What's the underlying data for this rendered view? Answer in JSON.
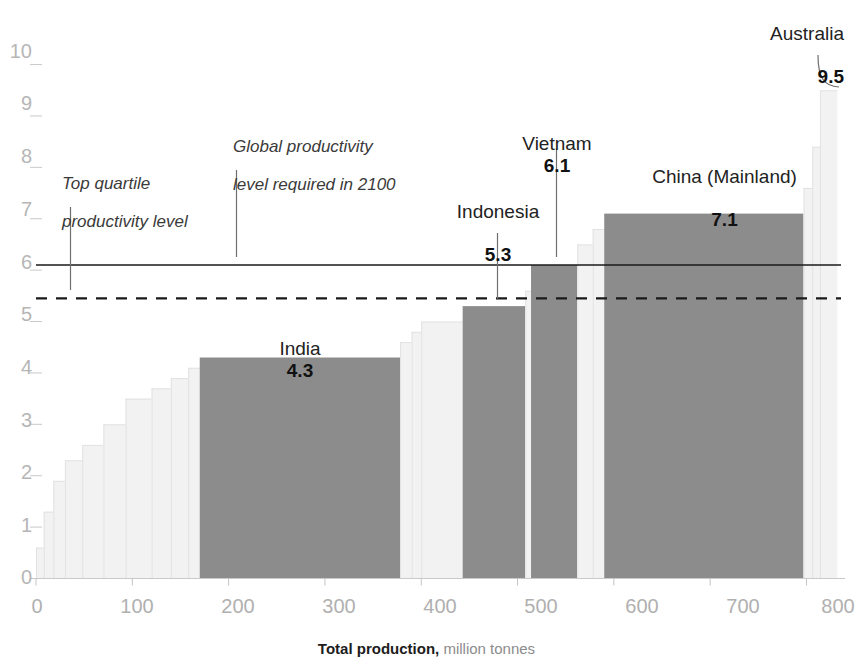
{
  "chart_data": {
    "type": "bar",
    "title": "",
    "subtitle": "",
    "xlabel_bold": "Total production,",
    "xlabel_rest": " million tonnes",
    "ylabel": "",
    "xlim": [
      0,
      840
    ],
    "ylim": [
      0,
      10.4
    ],
    "xticks": [
      0,
      100,
      200,
      300,
      400,
      500,
      600,
      700,
      800
    ],
    "xtick_labels": [
      "0",
      "100",
      "200",
      "300",
      "400",
      "500",
      "600",
      "700",
      "800"
    ],
    "yticks": [
      0,
      1,
      2,
      3,
      4,
      5,
      6,
      7,
      8,
      9,
      10
    ],
    "ytick_labels": [
      "0",
      "1",
      "2",
      "3",
      "4",
      "5",
      "6",
      "7",
      "8",
      "9",
      "10"
    ],
    "grid": false,
    "legend_position": "none",
    "highlight_color": "#8c8c8c",
    "muted_color": "#f2f2f2",
    "reference_line_color": "#1a1a1a",
    "axis_label_color": "#b4b4b4",
    "bars": [
      {
        "label": "",
        "x_start": 0,
        "x_end": 8,
        "value": 0.6,
        "highlighted": false
      },
      {
        "label": "",
        "x_start": 8,
        "x_end": 18,
        "value": 1.3,
        "highlighted": false
      },
      {
        "label": "",
        "x_start": 18,
        "x_end": 30,
        "value": 1.9,
        "highlighted": false
      },
      {
        "label": "",
        "x_start": 30,
        "x_end": 48,
        "value": 2.3,
        "highlighted": false
      },
      {
        "label": "",
        "x_start": 48,
        "x_end": 70,
        "value": 2.6,
        "highlighted": false
      },
      {
        "label": "",
        "x_start": 70,
        "x_end": 93,
        "value": 3.0,
        "highlighted": false
      },
      {
        "label": "",
        "x_start": 93,
        "x_end": 120,
        "value": 3.5,
        "highlighted": false
      },
      {
        "label": "",
        "x_start": 120,
        "x_end": 140,
        "value": 3.7,
        "highlighted": false
      },
      {
        "label": "",
        "x_start": 140,
        "x_end": 158,
        "value": 3.9,
        "highlighted": false
      },
      {
        "label": "",
        "x_start": 158,
        "x_end": 170,
        "value": 4.1,
        "highlighted": false
      },
      {
        "label": "India",
        "x_start": 170,
        "x_end": 378,
        "value": 4.3,
        "highlighted": true
      },
      {
        "label": "",
        "x_start": 378,
        "x_end": 390,
        "value": 4.6,
        "highlighted": false
      },
      {
        "label": "",
        "x_start": 390,
        "x_end": 400,
        "value": 4.8,
        "highlighted": false
      },
      {
        "label": "",
        "x_start": 400,
        "x_end": 443,
        "value": 5.0,
        "highlighted": false
      },
      {
        "label": "Indonesia",
        "x_start": 443,
        "x_end": 508,
        "value": 5.3,
        "highlighted": true
      },
      {
        "label": "",
        "x_start": 508,
        "x_end": 514,
        "value": 5.6,
        "highlighted": false
      },
      {
        "label": "Vietnam",
        "x_start": 514,
        "x_end": 562,
        "value": 6.1,
        "highlighted": true
      },
      {
        "label": "",
        "x_start": 562,
        "x_end": 578,
        "value": 6.5,
        "highlighted": false
      },
      {
        "label": "",
        "x_start": 578,
        "x_end": 590,
        "value": 6.8,
        "highlighted": false
      },
      {
        "label": "China (Mainland)",
        "x_start": 590,
        "x_end": 797,
        "value": 7.1,
        "highlighted": true
      },
      {
        "label": "",
        "x_start": 797,
        "x_end": 806,
        "value": 7.6,
        "highlighted": false
      },
      {
        "label": "",
        "x_start": 806,
        "x_end": 814,
        "value": 8.4,
        "highlighted": false
      },
      {
        "label": "Australia",
        "x_start": 814,
        "x_end": 832,
        "value": 9.5,
        "highlighted": false
      }
    ],
    "reference_lines": [
      {
        "name": "global-productivity-2100",
        "value": 6.1,
        "style": "solid",
        "label_line1": "Global productivity",
        "label_line2": "level required in 2100"
      },
      {
        "name": "top-quartile-productivity",
        "value": 5.45,
        "style": "dashed",
        "label_line1": "Top quartile",
        "label_line2": "productivity level"
      }
    ],
    "annotations": [
      {
        "name": "top-quartile-annotation",
        "line1": "Top quartile",
        "line2": "productivity level",
        "style": "italic"
      },
      {
        "name": "global-2100-annotation",
        "line1": "Global productivity",
        "line2": "level required in 2100",
        "style": "italic"
      },
      {
        "name": "india-annotation",
        "line1": "India",
        "value": "4.3",
        "style": "country"
      },
      {
        "name": "indonesia-annotation",
        "line1": "Indonesia",
        "value": "5.3",
        "style": "country"
      },
      {
        "name": "vietnam-annotation",
        "line1": "Vietnam",
        "value": "6.1",
        "style": "country"
      },
      {
        "name": "china-annotation",
        "line1": "China (Mainland)",
        "value": "7.1",
        "style": "country"
      },
      {
        "name": "australia-annotation",
        "line1": "Australia",
        "value": "9.5",
        "style": "country"
      }
    ]
  },
  "yticks": {
    "t0": "0",
    "t1": "1",
    "t2": "2",
    "t3": "3",
    "t4": "4",
    "t5": "5",
    "t6": "6",
    "t7": "7",
    "t8": "8",
    "t9": "9",
    "t10": "10"
  },
  "xticks": {
    "t0": "0",
    "t1": "100",
    "t2": "200",
    "t3": "300",
    "t4": "400",
    "t5": "500",
    "t6": "600",
    "t7": "700",
    "t8": "800"
  },
  "axis_title": {
    "bold": "Total production,",
    "rest": " million tonnes"
  },
  "annotations": {
    "top_quartile": {
      "line1": "Top quartile",
      "line2": "productivity level"
    },
    "global_2100": {
      "line1": "Global productivity",
      "line2": "level required in 2100"
    },
    "india": {
      "name": "India",
      "value": "4.3"
    },
    "indonesia": {
      "name": "Indonesia",
      "value": "5.3"
    },
    "vietnam": {
      "name": "Vietnam",
      "value": "6.1"
    },
    "china": {
      "name": "China (Mainland)",
      "value": "7.1"
    },
    "australia": {
      "name": "Australia",
      "value": "9.5"
    }
  }
}
